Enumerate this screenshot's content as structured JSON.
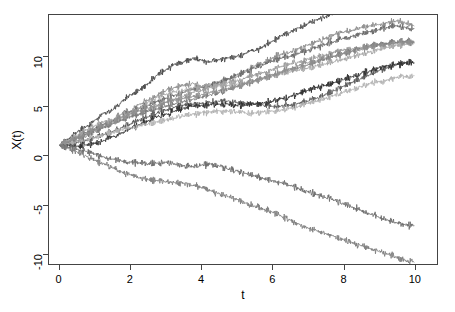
{
  "chart_data": {
    "type": "line",
    "title": "",
    "subtitle": "",
    "xlabel": "t",
    "ylabel": "X(t)",
    "xlim": [
      -0.3,
      10.65
    ],
    "ylim": [
      -11.1,
      14.3
    ],
    "xticks": [
      0,
      2,
      4,
      6,
      8,
      10
    ],
    "xtick_labels": [
      "0",
      "2",
      "4",
      "6",
      "8",
      "10"
    ],
    "yticks": [
      -10,
      -5,
      0,
      5,
      10
    ],
    "ytick_labels": [
      "-10",
      "-5",
      "0",
      "5",
      "10"
    ],
    "grid": false,
    "legend": "none",
    "box": true,
    "annotations": [],
    "x": [
      0,
      0.25,
      0.5,
      0.75,
      1,
      1.25,
      1.5,
      1.75,
      2,
      2.25,
      2.5,
      2.75,
      3,
      3.25,
      3.5,
      3.75,
      4,
      4.25,
      4.5,
      4.75,
      5,
      5.25,
      5.5,
      5.75,
      6,
      6.25,
      6.5,
      6.75,
      7,
      7.25,
      7.5,
      7.75,
      8,
      8.25,
      8.5,
      8.75,
      9,
      9.25,
      9.5,
      9.75,
      10
    ],
    "series": [
      {
        "name": "path-01",
        "color": "#4d4d4d",
        "values": [
          1,
          1.6,
          2.4,
          2.9,
          3.6,
          4.3,
          4.6,
          5.5,
          6.2,
          6.6,
          7.3,
          8.2,
          8.7,
          9.3,
          9.5,
          9.9,
          9.7,
          9.5,
          9.7,
          9.9,
          10.1,
          10.4,
          10.6,
          11.1,
          11.6,
          12.2,
          12.5,
          13.0,
          13.4,
          13.8,
          14.1,
          14.5,
          14.9,
          15.3,
          15.7,
          16.1,
          16.5,
          16.9,
          17.3,
          17.7,
          18.0
        ]
      },
      {
        "name": "path-02",
        "color": "#8c8c8c",
        "values": [
          1,
          1.3,
          1.8,
          2.2,
          2.6,
          3.1,
          3.6,
          4.2,
          4.5,
          5.2,
          5.6,
          6.1,
          6.6,
          6.9,
          7.1,
          7.4,
          7.0,
          7.2,
          7.5,
          7.7,
          8.0,
          8.6,
          9.1,
          9.4,
          9.9,
          10.3,
          10.5,
          10.9,
          11.2,
          11.6,
          11.9,
          12.3,
          12.5,
          12.7,
          13.0,
          13.2,
          13.3,
          13.5,
          13.7,
          13.5,
          13.2
        ]
      },
      {
        "name": "path-03",
        "color": "#6b6b6b",
        "values": [
          1,
          1.4,
          1.9,
          2.3,
          2.7,
          3.2,
          3.5,
          3.9,
          4.4,
          4.8,
          5.1,
          5.5,
          5.8,
          6.1,
          6.4,
          6.7,
          6.9,
          7.1,
          7.4,
          7.8,
          8.2,
          8.5,
          8.9,
          9.2,
          9.6,
          9.9,
          10.1,
          10.4,
          10.7,
          11.0,
          11.3,
          11.6,
          11.9,
          12.1,
          12.4,
          12.6,
          12.8,
          13.0,
          13.2,
          13.0,
          12.9
        ]
      },
      {
        "name": "path-04",
        "color": "#999999",
        "values": [
          1,
          1.2,
          1.5,
          1.9,
          2.4,
          2.8,
          3.3,
          3.6,
          4.0,
          4.2,
          4.6,
          5.0,
          5.4,
          5.7,
          6.0,
          6.4,
          6.6,
          6.9,
          7.2,
          7.4,
          7.6,
          7.9,
          8.2,
          8.4,
          8.7,
          9.0,
          9.3,
          9.5,
          9.8,
          10.0,
          10.2,
          10.5,
          10.7,
          10.8,
          11.0,
          11.2,
          11.3,
          11.4,
          11.5,
          11.6,
          11.6
        ]
      },
      {
        "name": "path-05",
        "color": "#7a7a7a",
        "values": [
          1,
          1.3,
          1.7,
          2.1,
          2.5,
          2.9,
          3.2,
          3.6,
          3.9,
          4.2,
          4.5,
          4.7,
          5.0,
          5.2,
          5.5,
          5.7,
          5.9,
          6.2,
          6.4,
          6.7,
          7.0,
          7.3,
          7.5,
          7.8,
          8.1,
          8.4,
          8.7,
          8.9,
          9.2,
          9.5,
          9.8,
          10.1,
          10.4,
          10.6,
          10.9,
          11.1,
          11.3,
          11.4,
          11.5,
          11.6,
          11.5
        ]
      },
      {
        "name": "path-06",
        "color": "#a6a6a6",
        "values": [
          1,
          1.5,
          2.0,
          2.6,
          3.0,
          3.4,
          3.6,
          3.9,
          4.3,
          4.8,
          5.4,
          5.9,
          6.2,
          6.5,
          6.6,
          6.8,
          7.0,
          7.0,
          7.1,
          7.1,
          7.2,
          7.4,
          7.6,
          7.8,
          8.1,
          8.3,
          8.5,
          8.7,
          8.9,
          9.1,
          9.3,
          9.5,
          9.8,
          10.0,
          10.3,
          10.5,
          10.8,
          11.0,
          11.2,
          11.3,
          11.4
        ]
      },
      {
        "name": "path-07",
        "color": "#595959",
        "values": [
          1,
          1.1,
          1.3,
          1.5,
          1.8,
          2.1,
          2.4,
          2.8,
          3.2,
          3.6,
          3.9,
          4.3,
          4.6,
          4.9,
          5.1,
          5.2,
          5.3,
          5.4,
          5.5,
          5.5,
          5.4,
          5.3,
          5.2,
          5.1,
          5.0,
          5.0,
          5.1,
          5.3,
          5.5,
          5.8,
          6.2,
          6.6,
          7.0,
          7.4,
          7.8,
          8.2,
          8.6,
          8.9,
          9.2,
          9.4,
          9.4
        ]
      },
      {
        "name": "path-08",
        "color": "#303030",
        "values": [
          1,
          1.0,
          0.9,
          1.0,
          1.2,
          1.5,
          1.9,
          2.3,
          2.7,
          3.1,
          3.5,
          3.9,
          4.2,
          4.5,
          4.8,
          5.0,
          5.1,
          5.2,
          5.2,
          5.2,
          5.1,
          5.1,
          5.2,
          5.3,
          5.5,
          5.8,
          6.0,
          6.3,
          6.6,
          6.9,
          7.1,
          7.4,
          7.7,
          8.0,
          8.3,
          8.6,
          8.9,
          9.1,
          9.3,
          9.4,
          9.4
        ]
      },
      {
        "name": "path-09",
        "color": "#b3b3b3",
        "values": [
          1,
          1.2,
          1.4,
          1.6,
          1.8,
          2.1,
          2.3,
          2.6,
          2.8,
          3.0,
          3.2,
          3.4,
          3.6,
          3.8,
          4.0,
          4.2,
          4.3,
          4.4,
          4.5,
          4.5,
          4.4,
          4.3,
          4.3,
          4.4,
          4.5,
          4.6,
          4.8,
          5.0,
          5.3,
          5.5,
          5.8,
          6.1,
          6.4,
          6.7,
          7.0,
          7.3,
          7.5,
          7.7,
          7.9,
          8.0,
          8.1
        ]
      },
      {
        "name": "path-10",
        "color": "#8f8f8f",
        "values": [
          1,
          1.4,
          1.8,
          2.2,
          2.6,
          3.0,
          3.4,
          3.8,
          4.2,
          4.5,
          4.8,
          5.1,
          5.4,
          5.6,
          5.8,
          6.0,
          6.2,
          6.4,
          6.6,
          6.8,
          7.0,
          7.3,
          7.6,
          7.9,
          8.2,
          8.5,
          8.8,
          9.1,
          9.4,
          9.6,
          9.9,
          10.1,
          10.4,
          10.6,
          10.8,
          11.0,
          11.2,
          11.3,
          11.4,
          11.5,
          11.5
        ]
      },
      {
        "name": "path-11",
        "color": "#6e6e6e",
        "values": [
          1,
          0.8,
          0.6,
          0.4,
          0.1,
          -0.2,
          -0.4,
          -0.6,
          -0.7,
          -0.8,
          -0.9,
          -0.8,
          -0.7,
          -0.9,
          -1.1,
          -1.2,
          -1.0,
          -0.9,
          -1.1,
          -1.4,
          -1.6,
          -1.9,
          -2.1,
          -2.4,
          -2.6,
          -2.8,
          -3.1,
          -3.4,
          -3.7,
          -4.0,
          -4.3,
          -4.6,
          -4.9,
          -5.3,
          -5.6,
          -6.0,
          -6.3,
          -6.6,
          -6.9,
          -7.1,
          -7.2
        ]
      },
      {
        "name": "path-12",
        "color": "#7f7f7f",
        "values": [
          1,
          0.7,
          0.3,
          -0.1,
          -0.5,
          -0.9,
          -1.3,
          -1.7,
          -2.0,
          -2.3,
          -2.5,
          -2.6,
          -2.7,
          -2.8,
          -2.9,
          -3.1,
          -3.3,
          -3.6,
          -3.9,
          -4.2,
          -4.5,
          -4.9,
          -5.2,
          -5.5,
          -5.8,
          -6.2,
          -6.6,
          -7.0,
          -7.4,
          -7.7,
          -8.0,
          -8.3,
          -8.6,
          -8.9,
          -9.2,
          -9.5,
          -9.8,
          -10.1,
          -10.4,
          -10.7,
          -10.9
        ]
      }
    ]
  }
}
